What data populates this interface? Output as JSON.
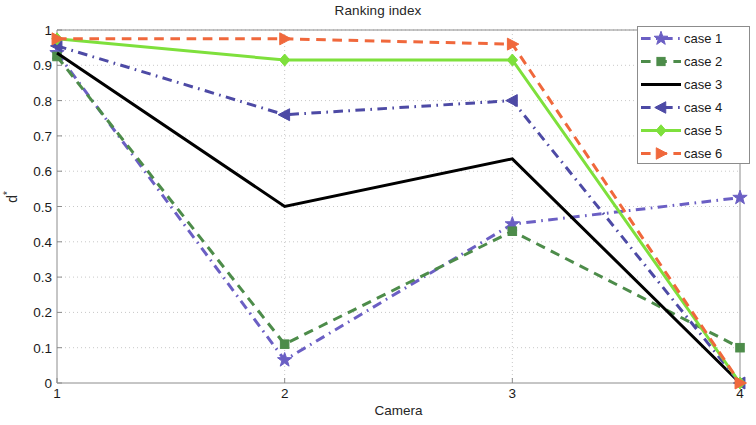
{
  "chart_data": {
    "type": "line",
    "title": "Ranking index",
    "xlabel": "Camera",
    "ylabel": "d*",
    "ylabel_base": "d",
    "ylabel_sup": "*",
    "x": [
      1,
      2,
      3,
      4
    ],
    "xticklabels": [
      "1",
      "2",
      "3",
      "4"
    ],
    "yticklabels": [
      "0",
      "0.1",
      "0.2",
      "0.3",
      "0.4",
      "0.5",
      "0.6",
      "0.7",
      "0.8",
      "0.9",
      "1"
    ],
    "ytickvalues": [
      0,
      0.1,
      0.2,
      0.3,
      0.4,
      0.5,
      0.6,
      0.7,
      0.8,
      0.9,
      1
    ],
    "xlim": [
      1,
      4
    ],
    "ylim": [
      0,
      1
    ],
    "grid": true,
    "grid_style": "dotted",
    "legend_position": "top-right",
    "series": [
      {
        "name": "case 1",
        "values": [
          0.935,
          0.065,
          0.45,
          0.525
        ],
        "color": "#6b5fc4",
        "marker": "star",
        "dash": "dashdot"
      },
      {
        "name": "case 2",
        "values": [
          0.925,
          0.11,
          0.43,
          0.1
        ],
        "color": "#4d8c4a",
        "marker": "square",
        "dash": "dashed"
      },
      {
        "name": "case 3",
        "values": [
          0.935,
          0.5,
          0.635,
          0.0
        ],
        "color": "#000000",
        "marker": "none",
        "dash": "solid"
      },
      {
        "name": "case 4",
        "values": [
          0.955,
          0.76,
          0.8,
          0.0
        ],
        "color": "#4d4aa5",
        "marker": "left-triangle",
        "dash": "dashdot"
      },
      {
        "name": "case 5",
        "values": [
          0.975,
          0.915,
          0.915,
          0.0
        ],
        "color": "#7ee03c",
        "marker": "diamond",
        "dash": "solid"
      },
      {
        "name": "case 6",
        "values": [
          0.975,
          0.975,
          0.96,
          0.0
        ],
        "color": "#f0683c",
        "marker": "right-triangle",
        "dash": "dashed"
      }
    ]
  },
  "legend": {
    "items": [
      {
        "label": "case 1"
      },
      {
        "label": "case 2"
      },
      {
        "label": "case 3"
      },
      {
        "label": "case 4"
      },
      {
        "label": "case 5"
      },
      {
        "label": "case 6"
      }
    ]
  },
  "colors": {
    "axis": "#8c8c8c",
    "grid": "#c8c8c8",
    "text": "#1a1a1a",
    "background": "#ffffff"
  }
}
